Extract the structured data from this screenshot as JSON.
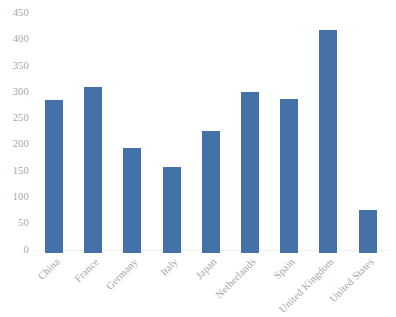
{
  "chart_data": {
    "type": "bar",
    "title": "",
    "subtitle": "",
    "xlabel": "",
    "ylabel": "",
    "categories": [
      "China",
      "France",
      "Germany",
      "Italy",
      "Japan",
      "Netherlands",
      "Spain",
      "United Kingdom",
      "United States"
    ],
    "values": [
      292,
      315,
      200,
      163,
      232,
      306,
      293,
      425,
      81
    ],
    "ylim": [
      0,
      450
    ],
    "ytick_labels": [
      "450",
      "400",
      "350",
      "300",
      "250",
      "200",
      "150",
      "100",
      "50",
      "0"
    ],
    "ytick_values": [
      450,
      400,
      350,
      300,
      250,
      200,
      150,
      100,
      50,
      0
    ],
    "grid": false,
    "legend": false,
    "legend_position": "none",
    "series": [
      {
        "name": "",
        "values": [
          292,
          315,
          200,
          163,
          232,
          306,
          293,
          425,
          81
        ]
      }
    ]
  },
  "style": {
    "bar_color": "#4472a8",
    "tick_label_color": "#a6a6a6",
    "axis_line_color": "#f2f2f2",
    "background": "#ffffff"
  }
}
